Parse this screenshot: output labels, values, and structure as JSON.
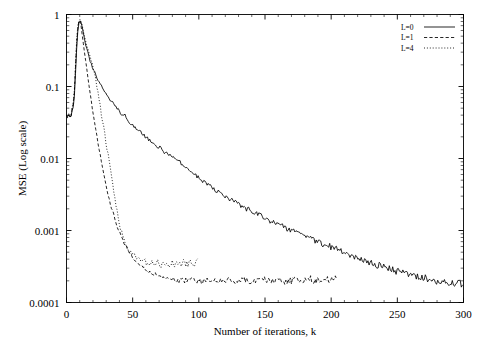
{
  "chart_data": {
    "type": "line",
    "title": "",
    "xlabel": "Number of iterations, k",
    "ylabel": "MSE (Log scale)",
    "yscale": "log",
    "xlim": [
      0,
      300
    ],
    "ylim": [
      0.0001,
      1
    ],
    "grid": false,
    "legend_position": "top-right",
    "xticks": [
      0,
      50,
      100,
      150,
      200,
      250,
      300
    ],
    "xticklabels": [
      "0",
      "50",
      "100",
      "150",
      "200",
      "250",
      "300"
    ],
    "yticks": [
      0.0001,
      0.001,
      0.01,
      0.1,
      1
    ],
    "yticklabels": [
      "0.0001",
      "0.001",
      "0.01",
      "0.1",
      "1"
    ],
    "series": [
      {
        "name": "L=0",
        "style": "solid",
        "color": "#000000",
        "x": [
          0,
          1,
          2,
          3,
          4,
          5,
          6,
          7,
          8,
          9,
          10,
          11,
          12,
          13,
          14,
          15,
          16,
          17,
          18,
          19,
          20,
          22,
          24,
          26,
          28,
          30,
          32,
          34,
          36,
          38,
          40,
          42,
          44,
          46,
          48,
          50,
          53,
          56,
          59,
          62,
          65,
          68,
          71,
          74,
          77,
          80,
          83,
          86,
          89,
          92,
          95,
          98,
          101,
          104,
          107,
          110,
          114,
          118,
          122,
          126,
          130,
          134,
          138,
          142,
          146,
          150,
          155,
          160,
          165,
          170,
          175,
          180,
          185,
          190,
          195,
          200,
          205,
          210,
          215,
          220,
          225,
          230,
          235,
          240,
          245,
          250,
          255,
          260,
          265,
          270,
          275,
          280,
          285,
          290,
          295,
          300
        ],
        "y": [
          0.04,
          0.038,
          0.042,
          0.035,
          0.045,
          0.05,
          0.075,
          0.18,
          0.45,
          0.72,
          0.82,
          0.78,
          0.66,
          0.52,
          0.42,
          0.35,
          0.3,
          0.255,
          0.225,
          0.2,
          0.178,
          0.148,
          0.122,
          0.105,
          0.092,
          0.079,
          0.07,
          0.062,
          0.057,
          0.05,
          0.046,
          0.039,
          0.042,
          0.035,
          0.031,
          0.029,
          0.026,
          0.0235,
          0.0205,
          0.0185,
          0.0168,
          0.0148,
          0.0142,
          0.0122,
          0.0115,
          0.0104,
          0.0092,
          0.0088,
          0.0076,
          0.0072,
          0.0063,
          0.0058,
          0.0052,
          0.0047,
          0.0043,
          0.0039,
          0.0035,
          0.0031,
          0.0028,
          0.0026,
          0.0023,
          0.00205,
          0.00195,
          0.00175,
          0.00162,
          0.00148,
          0.00132,
          0.0012,
          0.0011,
          0.001,
          0.00092,
          0.00084,
          0.00077,
          0.0007,
          0.00064,
          0.00059,
          0.00054,
          0.0005,
          0.00046,
          0.00042,
          0.00039,
          0.00036,
          0.00033,
          0.00031,
          0.00029,
          0.00027,
          0.00026,
          0.00024,
          0.00023,
          0.00022,
          0.00021,
          0.0002,
          0.000195,
          0.00019,
          0.000185,
          0.00018
        ]
      },
      {
        "name": "L=1",
        "style": "dashed",
        "color": "#000000",
        "x": [
          0,
          1,
          2,
          3,
          4,
          5,
          6,
          7,
          8,
          9,
          10,
          11,
          12,
          13,
          14,
          15,
          16,
          17,
          18,
          19,
          20,
          21,
          22,
          23,
          24,
          25,
          26,
          27,
          28,
          29,
          30,
          32,
          34,
          36,
          38,
          40,
          42,
          44,
          46,
          48,
          50,
          53,
          56,
          59,
          62,
          65,
          68,
          71,
          74,
          77,
          80,
          84,
          88,
          92,
          96,
          100,
          105,
          110,
          115,
          120,
          125,
          130,
          135,
          140,
          145,
          150,
          155,
          160,
          165,
          170,
          175,
          180,
          185,
          190,
          195,
          200,
          205
        ],
        "y": [
          0.04,
          0.036,
          0.043,
          0.033,
          0.048,
          0.055,
          0.085,
          0.22,
          0.52,
          0.78,
          0.86,
          0.7,
          0.5,
          0.36,
          0.26,
          0.19,
          0.138,
          0.102,
          0.078,
          0.058,
          0.044,
          0.034,
          0.026,
          0.0205,
          0.0158,
          0.0125,
          0.0098,
          0.0078,
          0.0062,
          0.005,
          0.004,
          0.0028,
          0.00205,
          0.00155,
          0.0012,
          0.00095,
          0.00078,
          0.00066,
          0.00056,
          0.00049,
          0.00043,
          0.00037,
          0.00033,
          0.0003,
          0.00027,
          0.00025,
          0.00024,
          0.00023,
          0.000225,
          0.00022,
          0.00021,
          0.000205,
          0.0002,
          0.000205,
          0.00021,
          0.000195,
          0.0002,
          0.000205,
          0.000195,
          0.00021,
          0.0002,
          0.000195,
          0.000205,
          0.0002,
          0.000195,
          0.00021,
          0.000205,
          0.0002,
          0.000195,
          0.0002,
          0.000205,
          0.000195,
          0.00021,
          0.0002,
          0.000205,
          0.00021,
          0.00022
        ]
      },
      {
        "name": "L=4",
        "style": "dotted",
        "color": "#000000",
        "x": [
          0,
          1,
          2,
          3,
          4,
          5,
          6,
          7,
          8,
          9,
          10,
          11,
          12,
          13,
          14,
          15,
          16,
          17,
          18,
          19,
          20,
          21,
          22,
          23,
          24,
          25,
          26,
          27,
          28,
          29,
          30,
          31,
          32,
          33,
          34,
          35,
          36,
          37,
          38,
          39,
          40,
          42,
          44,
          46,
          48,
          50,
          52,
          54,
          56,
          58,
          60,
          63,
          66,
          69,
          72,
          75,
          78,
          81,
          84,
          87,
          90,
          93,
          96,
          100
        ],
        "y": [
          0.04,
          0.037,
          0.044,
          0.034,
          0.047,
          0.058,
          0.09,
          0.25,
          0.58,
          0.8,
          0.88,
          0.8,
          0.68,
          0.56,
          0.46,
          0.4,
          0.34,
          0.3,
          0.26,
          0.22,
          0.19,
          0.155,
          0.125,
          0.1,
          0.078,
          0.06,
          0.046,
          0.035,
          0.027,
          0.021,
          0.016,
          0.0125,
          0.0095,
          0.0072,
          0.0055,
          0.0042,
          0.0032,
          0.0025,
          0.00195,
          0.00155,
          0.00125,
          0.00088,
          0.0007,
          0.00058,
          0.0005,
          0.00046,
          0.00042,
          0.0004,
          0.00038,
          0.00037,
          0.00036,
          0.00035,
          0.00034,
          0.00035,
          0.00034,
          0.00033,
          0.00034,
          0.00035,
          0.00034,
          0.00035,
          0.00036,
          0.00035,
          0.00036,
          0.00037
        ]
      }
    ]
  },
  "legend": {
    "entries": [
      {
        "label": "L=0",
        "style": "solid"
      },
      {
        "label": "L=1",
        "style": "dashed"
      },
      {
        "label": "L=4",
        "style": "dotted"
      }
    ]
  }
}
